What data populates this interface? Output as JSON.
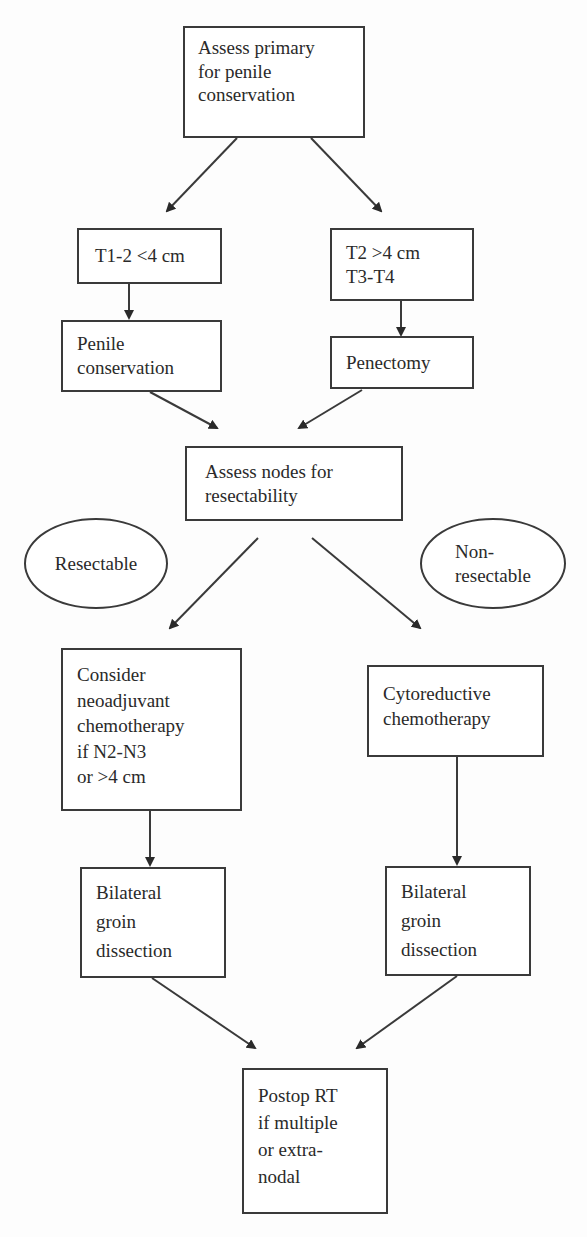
{
  "flowchart": {
    "nodes": {
      "assess_primary": {
        "label": "Assess primary\nfor penile\nconservation",
        "shape": "rect"
      },
      "t1_2": {
        "label": "T1-2 <4 cm",
        "shape": "rect"
      },
      "t2_t3_t4": {
        "label": "T2 >4 cm\nT3-T4",
        "shape": "rect"
      },
      "penile_conservation": {
        "label": "Penile\nconservation",
        "shape": "rect"
      },
      "penectomy": {
        "label": "Penectomy",
        "shape": "rect"
      },
      "assess_nodes": {
        "label": "Assess nodes for\nresectability",
        "shape": "rect"
      },
      "resectable": {
        "label": "Resectable",
        "shape": "ellipse"
      },
      "non_resectable": {
        "label": "Non-\nresectable",
        "shape": "ellipse"
      },
      "neoadjuvant": {
        "label": "Consider\nneoadjuvant\nchemotherapy\nif N2-N3\nor >4 cm",
        "shape": "rect"
      },
      "cytoreductive": {
        "label": "Cytoreductive\nchemotherapy",
        "shape": "rect"
      },
      "bilateral_left": {
        "label": "Bilateral\ngroin\ndissection",
        "shape": "rect"
      },
      "bilateral_right": {
        "label": "Bilateral\ngroin\ndissection",
        "shape": "rect"
      },
      "postop_rt": {
        "label": "Postop RT\nif multiple\nor extra-\nnodal",
        "shape": "rect"
      }
    },
    "edges": [
      [
        "assess_primary",
        "t1_2"
      ],
      [
        "assess_primary",
        "t2_t3_t4"
      ],
      [
        "t1_2",
        "penile_conservation"
      ],
      [
        "t2_t3_t4",
        "penectomy"
      ],
      [
        "penile_conservation",
        "assess_nodes"
      ],
      [
        "penectomy",
        "assess_nodes"
      ],
      [
        "assess_nodes",
        "neoadjuvant"
      ],
      [
        "assess_nodes",
        "cytoreductive"
      ],
      [
        "neoadjuvant",
        "bilateral_left"
      ],
      [
        "cytoreductive",
        "bilateral_right"
      ],
      [
        "bilateral_left",
        "postop_rt"
      ],
      [
        "bilateral_right",
        "postop_rt"
      ]
    ],
    "colors": {
      "stroke": "#3a3a3a",
      "text": "#2a2a2a",
      "background": "#fdfdfd"
    }
  }
}
